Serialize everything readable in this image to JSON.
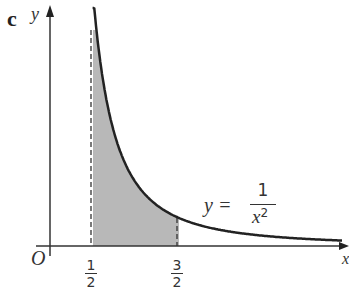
{
  "figure": {
    "part_label": "c",
    "y_axis_label": "y",
    "x_axis_label": "x",
    "origin_label": "O",
    "curve_label": {
      "lhs": "y =",
      "numerator": "1",
      "denominator": "x",
      "exponent": "2"
    },
    "ticks": [
      {
        "num": "1",
        "den": "2",
        "value": 0.5
      },
      {
        "num": "3",
        "den": "2",
        "value": 1.5
      }
    ],
    "shaded_region": {
      "from": 0.5,
      "to": 1.5,
      "color": "#b8b8b8"
    },
    "curve_color": "#222222"
  },
  "chart_data": {
    "type": "area",
    "title": "",
    "function": "y = 1/x^2",
    "xlabel": "x",
    "ylabel": "y",
    "shaded_interval": [
      0.5,
      1.5
    ],
    "x_ticks": [
      "1/2",
      "3/2"
    ],
    "x": [
      0.5,
      0.75,
      1.0,
      1.25,
      1.5,
      2.0,
      2.5,
      3.0
    ],
    "values": [
      4.0,
      1.78,
      1.0,
      0.64,
      0.444,
      0.25,
      0.16,
      0.111
    ]
  }
}
